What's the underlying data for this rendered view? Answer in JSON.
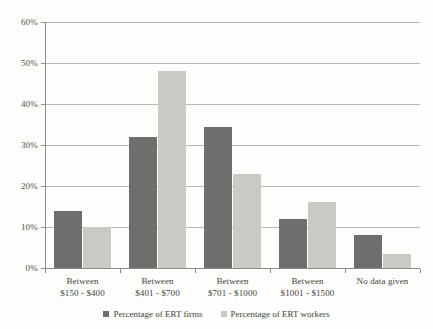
{
  "chart_data": {
    "type": "bar",
    "title": "",
    "xlabel": "",
    "ylabel": "",
    "ylim": [
      0,
      60
    ],
    "ytick_step": 10,
    "grid": true,
    "legend_position": "bottom",
    "categories": [
      "Between\n$150 - $400",
      "Between\n$401 - $700",
      "Between\n$701 - $1000",
      "Between\n$1001 - $1500",
      "No data given"
    ],
    "category_lines": [
      {
        "line1": "Between",
        "line2": "$150 - $400"
      },
      {
        "line1": "Between",
        "line2": "$401 - $700"
      },
      {
        "line1": "Between",
        "line2": "$701 - $1000"
      },
      {
        "line1": "Between",
        "line2": "$1001 - $1500"
      },
      {
        "line1": "No data given",
        "line2": ""
      }
    ],
    "ytick_labels": [
      "0%",
      "10%",
      "20%",
      "30%",
      "40%",
      "50%",
      "60%"
    ],
    "ytick_values": [
      0,
      10,
      20,
      30,
      40,
      50,
      60
    ],
    "series": [
      {
        "name": "Percentage of ERT firms",
        "color": "#6e6e6c",
        "values": [
          14,
          32,
          34.5,
          12,
          8
        ]
      },
      {
        "name": "Percentage of ERT workers",
        "color": "#cacac4",
        "values": [
          10,
          48,
          23,
          16,
          3.5
        ]
      }
    ]
  },
  "legend": {
    "items": [
      {
        "label": "Percentage of ERT firms"
      },
      {
        "label": "Percentage of ERT workers"
      }
    ]
  }
}
